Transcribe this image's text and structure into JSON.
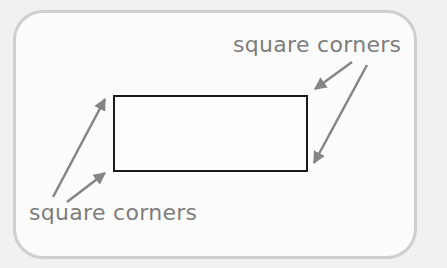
{
  "diagram": {
    "labels": {
      "top_right": "square corners",
      "bottom_left": "square corners"
    },
    "colors": {
      "background": "#f1f1f1",
      "panel": "#fcfcfc",
      "panel_border": "#cfcfcf",
      "rectangle_stroke": "#1a1a1a",
      "arrow": "#858585",
      "label_text": "#7d7d7d"
    }
  }
}
